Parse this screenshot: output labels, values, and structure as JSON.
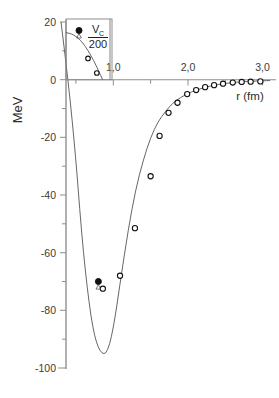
{
  "chart_data": {
    "type": "line",
    "title": "",
    "xlabel": "r (fm)",
    "ylabel": "MeV",
    "xlim": [
      0.0,
      3.15
    ],
    "ylim": [
      -100,
      20
    ],
    "grid": false,
    "legend_position": "inset-top-left",
    "x_ticks": [
      1.0,
      2.0,
      3.0
    ],
    "x_tick_labels": [
      "1,0",
      "2,0",
      "3,0"
    ],
    "x_minor_ticks": [
      0.5,
      1.5,
      2.5
    ],
    "y_ticks": [
      20,
      0,
      -20,
      -40,
      -60,
      -80,
      -100
    ],
    "y_tick_labels": [
      "20",
      "0",
      "-20",
      "-40",
      "-60",
      "-80",
      "-100"
    ],
    "y_minor_ticks": [
      10,
      -10,
      -30,
      -50,
      -70,
      -90
    ],
    "series": [
      {
        "name": "potential-curve",
        "style": "solid-line",
        "x": [
          0.3,
          0.4,
          0.5,
          0.55,
          0.6,
          0.65,
          0.7,
          0.75,
          0.8,
          0.85,
          0.9,
          0.95,
          1.0,
          1.05,
          1.1,
          1.2,
          1.3,
          1.4,
          1.5,
          1.6,
          1.7,
          1.8,
          1.9,
          2.0,
          2.1,
          2.2,
          2.3,
          2.4,
          2.5,
          2.6,
          2.7,
          2.8,
          2.9,
          3.0,
          3.1
        ],
        "y": [
          20.0,
          -1.0,
          -28.0,
          -45.0,
          -60.0,
          -72.0,
          -82.0,
          -89.0,
          -93.0,
          -95.0,
          -95.0,
          -92.0,
          -86.0,
          -78.0,
          -69.0,
          -52.0,
          -38.0,
          -28.0,
          -20.0,
          -14.5,
          -11.0,
          -8.0,
          -6.2,
          -4.8,
          -3.7,
          -2.9,
          -2.2,
          -1.7,
          -1.3,
          -1.0,
          -0.8,
          -0.6,
          -0.5,
          -0.4,
          -0.3
        ]
      },
      {
        "name": "open-circle-data-points",
        "style": "open-circle",
        "x": [
          0.86,
          1.09,
          1.29,
          1.5,
          1.62,
          1.74,
          1.86,
          1.99,
          2.11,
          2.23,
          2.35,
          2.47,
          2.6,
          2.72,
          2.84,
          2.97
        ],
        "y": [
          -72.5,
          -68.0,
          -51.5,
          -33.5,
          -19.5,
          -11.5,
          -8.0,
          -5.0,
          -3.6,
          -2.6,
          -1.9,
          -1.4,
          -1.0,
          -0.8,
          -0.7,
          -0.6
        ]
      },
      {
        "name": "filled-circle-data-point",
        "style": "filled-circle-with-triangle",
        "x": [
          0.8
        ],
        "y": [
          -70.0
        ]
      }
    ],
    "inset": {
      "name": "coulomb-inset",
      "label_numerator": "V",
      "label_subscript": "C",
      "label_denominator": "200",
      "xlim": [
        0.0,
        0.6
      ],
      "ylim": [
        0,
        20
      ],
      "curve": {
        "x": [
          0.0,
          0.05,
          0.1,
          0.15,
          0.2,
          0.25,
          0.3,
          0.35,
          0.4,
          0.45,
          0.5
        ],
        "y": [
          15.5,
          15.3,
          14.8,
          14.0,
          12.9,
          11.4,
          9.6,
          7.5,
          5.2,
          2.6,
          0.0
        ]
      },
      "open_points": {
        "x": [
          0.3,
          0.42
        ],
        "y": [
          7.0,
          2.2
        ]
      },
      "legend_marker": "filled-circle-with-triangle"
    }
  },
  "axis": {
    "y_label": "MeV",
    "x_label": "r (fm)"
  },
  "colors": {
    "curve": "#555555",
    "axis": "#8e8e8e",
    "marker_edge": "#111111",
    "marker_fill": "#ffffff",
    "text": "#2b2b2b",
    "background": "#ffffff"
  }
}
